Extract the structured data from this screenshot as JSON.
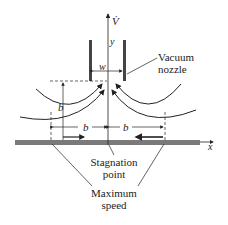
{
  "diagram": {
    "labels": {
      "flow_rate": "V̇",
      "y_axis": "y",
      "x_axis": "x",
      "width": "w",
      "height_b": "b",
      "left_b": "b",
      "right_b": "b",
      "nozzle_line1": "Vacuum",
      "nozzle_line2": "nozzle",
      "stagnation_line1": "Stagnation",
      "stagnation_line2": "point",
      "maxspeed_line1": "Maximum",
      "maxspeed_line2": "speed"
    },
    "colors": {
      "ink": "#222222",
      "ground": "#7a7a7a",
      "nozzle": "#444444"
    }
  }
}
